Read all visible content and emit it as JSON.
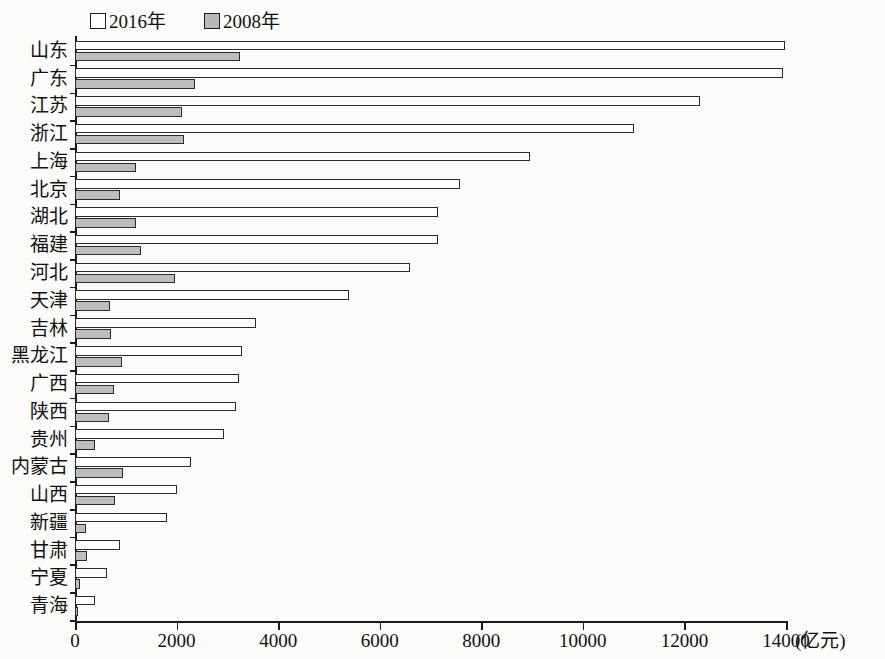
{
  "chart_data": {
    "type": "bar",
    "orientation": "horizontal",
    "title": "",
    "xlabel": "(亿元)",
    "ylabel": "",
    "xlim": [
      0,
      14000
    ],
    "xticks": [
      0,
      2000,
      4000,
      6000,
      8000,
      10000,
      12000,
      14000
    ],
    "xtick_labels": [
      "0",
      "2000",
      "4000",
      "6000",
      "8000",
      "10000",
      "12000",
      "14000"
    ],
    "grid": false,
    "legend_position": "top-left",
    "categories": [
      "山东",
      "广东",
      "江苏",
      "浙江",
      "上海",
      "北京",
      "湖北",
      "福建",
      "河北",
      "天津",
      "吉林",
      "黑龙江",
      "广西",
      "陕西",
      "贵州",
      "内蒙古",
      "山西",
      "新疆",
      "甘肃",
      "宁夏",
      "青海"
    ],
    "series": [
      {
        "name": "2016年",
        "color": "#ffffff",
        "values": [
          13980,
          13950,
          12300,
          11000,
          8950,
          7580,
          7150,
          7150,
          6600,
          5400,
          3560,
          3290,
          3230,
          3170,
          2930,
          2280,
          2010,
          1810,
          880,
          630,
          400
        ]
      },
      {
        "name": "2008年",
        "color": "#bdbdbd",
        "values": [
          3250,
          2360,
          2100,
          2150,
          1200,
          880,
          1200,
          1300,
          1970,
          690,
          700,
          925,
          770,
          670,
          390,
          950,
          790,
          220,
          230,
          100,
          60
        ]
      }
    ]
  },
  "legend": {
    "items": [
      {
        "label": "2016年",
        "swatch": "fill-white"
      },
      {
        "label": "2008年",
        "swatch": "fill-gray"
      }
    ]
  },
  "axis": {
    "unit_label": "(亿元)"
  }
}
